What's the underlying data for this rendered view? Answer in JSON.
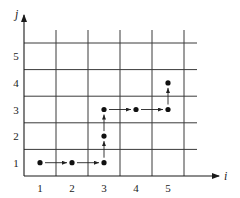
{
  "diagram": {
    "x_axis_label": "i",
    "y_axis_label": "j",
    "x_ticks": [
      "1",
      "2",
      "3",
      "4",
      "5"
    ],
    "y_ticks": [
      "1",
      "2",
      "3",
      "4",
      "5"
    ],
    "grid_columns": 5,
    "grid_rows": 5,
    "path_points": [
      {
        "i": 1,
        "j": 1
      },
      {
        "i": 2,
        "j": 1
      },
      {
        "i": 3,
        "j": 1
      },
      {
        "i": 3,
        "j": 2
      },
      {
        "i": 3,
        "j": 3
      },
      {
        "i": 4,
        "j": 3
      },
      {
        "i": 5,
        "j": 3
      },
      {
        "i": 5,
        "j": 4
      }
    ],
    "arrows_connect_consecutive_points": true
  }
}
